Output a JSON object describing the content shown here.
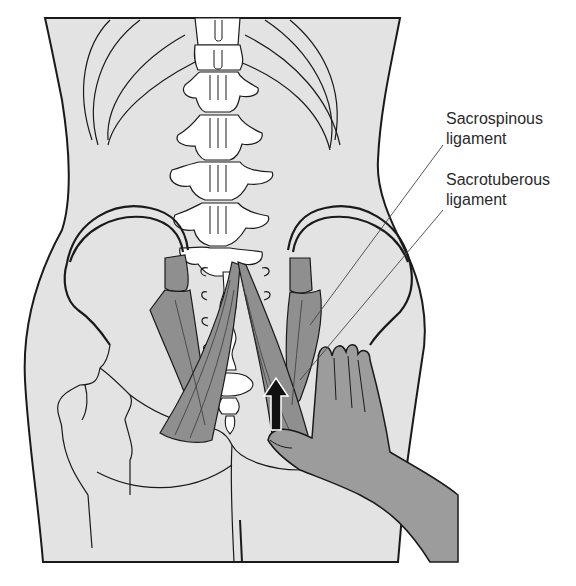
{
  "figure": {
    "colors": {
      "background": "#ffffff",
      "body_fill": "#e3e3e3",
      "bone_fill": "#ffffff",
      "ligament_fill": "#8f8f8f",
      "hand_fill": "#9c9c9c",
      "outline": "#1a1a1a",
      "arrow_fill": "#111111"
    },
    "icons": {
      "arrow": "up-arrow-icon"
    }
  },
  "labels": {
    "sacrospinous": {
      "line1": "Sacrospinous",
      "line2": "ligament"
    },
    "sacrotuberous": {
      "line1": "Sacrotuberous",
      "line2": "ligament"
    }
  }
}
